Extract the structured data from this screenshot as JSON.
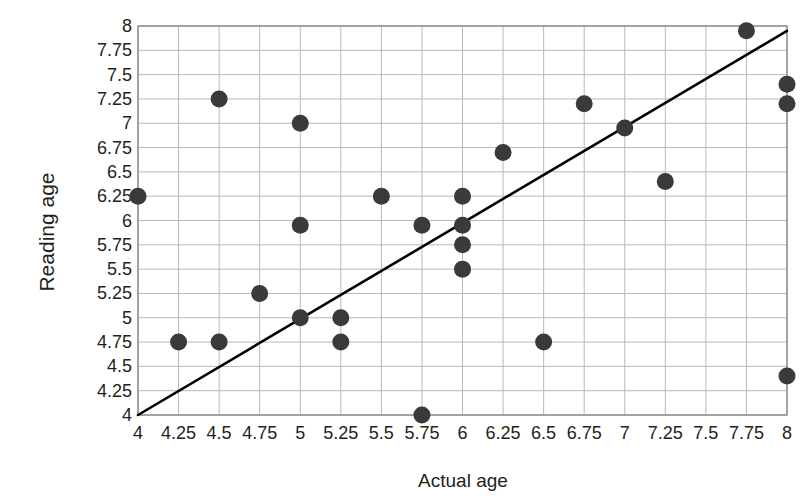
{
  "chart_data": {
    "type": "scatter",
    "title": "",
    "xlabel": "Actual age",
    "ylabel": "Reading age",
    "xlim": [
      4,
      8
    ],
    "ylim": [
      4,
      8
    ],
    "grid": true,
    "legend": "none",
    "xticks": [
      "4",
      "4.25",
      "4.5",
      "4.75",
      "5",
      "5.25",
      "5.5",
      "5.75",
      "6",
      "6.25",
      "6.5",
      "6.75",
      "7",
      "7.25",
      "7.5",
      "7.75",
      "8"
    ],
    "yticks": [
      "8",
      "7.75",
      "7.5",
      "7.25",
      "7",
      "6.75",
      "6.5",
      "6.25",
      "6",
      "5.75",
      "5.5",
      "5.25",
      "5",
      "4.75",
      "4.5",
      "4.25",
      "4"
    ],
    "x": [
      4,
      4.25,
      4.5,
      4.5,
      4.75,
      5,
      5,
      5,
      5.25,
      5.25,
      5.5,
      5.75,
      5.75,
      6,
      6,
      6,
      6,
      6.25,
      6.5,
      6.75,
      7,
      7.25,
      7.75,
      8,
      8,
      8
    ],
    "y": [
      6.25,
      4.75,
      4.75,
      7.25,
      5.25,
      5,
      5.95,
      7,
      5,
      4.75,
      6.25,
      5.95,
      4,
      6.25,
      5.95,
      5.75,
      5.5,
      6.7,
      4.75,
      7.2,
      6.95,
      6.4,
      7.95,
      7.4,
      7.2,
      4.4
    ],
    "points": [
      {
        "x": 4,
        "y": 6.25
      },
      {
        "x": 4.25,
        "y": 4.75
      },
      {
        "x": 4.5,
        "y": 4.75
      },
      {
        "x": 4.5,
        "y": 7.25
      },
      {
        "x": 4.75,
        "y": 5.25
      },
      {
        "x": 5,
        "y": 5
      },
      {
        "x": 5,
        "y": 5.95
      },
      {
        "x": 5,
        "y": 7
      },
      {
        "x": 5.25,
        "y": 5
      },
      {
        "x": 5.25,
        "y": 4.75
      },
      {
        "x": 5.5,
        "y": 6.25
      },
      {
        "x": 5.75,
        "y": 5.95
      },
      {
        "x": 5.75,
        "y": 4
      },
      {
        "x": 6,
        "y": 6.25
      },
      {
        "x": 6,
        "y": 5.95
      },
      {
        "x": 6,
        "y": 5.75
      },
      {
        "x": 6,
        "y": 5.5
      },
      {
        "x": 6.25,
        "y": 6.7
      },
      {
        "x": 6.5,
        "y": 4.75
      },
      {
        "x": 6.75,
        "y": 7.2
      },
      {
        "x": 7,
        "y": 6.95
      },
      {
        "x": 7.25,
        "y": 6.4
      },
      {
        "x": 7.75,
        "y": 7.95
      },
      {
        "x": 8,
        "y": 7.4
      },
      {
        "x": 8,
        "y": 7.2
      },
      {
        "x": 8,
        "y": 4.4
      }
    ],
    "trend_line": {
      "name": "line of best fit",
      "x1": 4,
      "y1": 4,
      "x2": 8,
      "y2": 7.95
    },
    "marker_color": "#3a3a3a",
    "line_color": "#000000",
    "grid_color": "#b8b8b8",
    "axis_color": "#8c8c8c"
  }
}
